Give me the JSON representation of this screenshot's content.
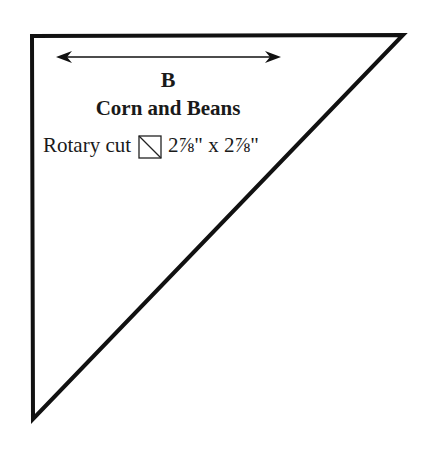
{
  "pattern_piece": {
    "letter": "B",
    "name": "Corn and Beans",
    "cut_method": "Rotary cut",
    "cut_icon": "half-square-triangle-icon",
    "dimensions": "2⅞\" x 2⅞\"",
    "shape": "right-triangle",
    "grainline": "double-headed-arrow"
  },
  "colors": {
    "stroke": "#111111",
    "background": "#ffffff"
  }
}
